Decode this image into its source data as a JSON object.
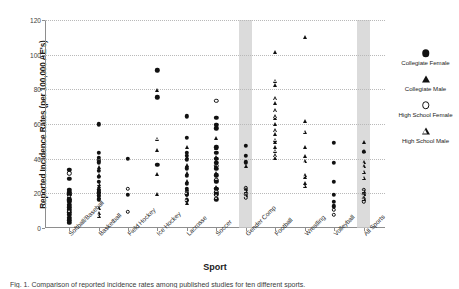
{
  "chart_data": {
    "type": "scatter",
    "title": "",
    "xlabel": "Sport",
    "ylabel": "Reported Incidence Rates (per 100,000 AE's)",
    "ylim": [
      0,
      120
    ],
    "yticks": [
      0,
      20,
      40,
      60,
      80,
      100,
      120
    ],
    "grid": true,
    "legend_position": "right",
    "categories": [
      "Softball/Baseball",
      "Basketball",
      "Field Hockey",
      "Ice Hockey",
      "Lacrosse",
      "Soccer",
      "Gender Comp",
      "Football",
      "Wrestling",
      "Volleyball",
      "All Sports"
    ],
    "highlighted_categories": [
      "Gender Comp",
      "All Sports"
    ],
    "series": [
      {
        "name": "Collegiate Female",
        "marker": "filled-circle",
        "color": "#111111",
        "points": [
          {
            "category": "Softball/Baseball",
            "values": [
              33.5,
              28.5,
              22.0,
              20.5,
              19.5,
              16.5,
              15.0,
              13.5,
              12.0,
              10.5,
              9.0,
              7.5,
              6.0,
              4.5,
              3.0
            ]
          },
          {
            "category": "Basketball",
            "values": [
              59.8,
              43.5,
              40.5,
              38.0,
              33.0,
              29.5,
              26.5,
              22.0,
              20.5,
              18.5,
              16.5
            ]
          },
          {
            "category": "Field Hockey",
            "values": [
              40.0,
              19.0
            ]
          },
          {
            "category": "Ice Hockey",
            "values": [
              91.0,
              75.5,
              36.5
            ]
          },
          {
            "category": "Lacrosse",
            "values": [
              64.5,
              52.0,
              43.5,
              41.5,
              39.5,
              34.5,
              30.0,
              25.5,
              22.5,
              19.5,
              16.0
            ]
          },
          {
            "category": "Soccer",
            "values": [
              63.5,
              59.5,
              57.5,
              46.5,
              43.5,
              40.0,
              37.5,
              34.0,
              30.5,
              26.5,
              22.5,
              19.5,
              16.5
            ]
          },
          {
            "category": "Gender Comp",
            "values": [
              47.5,
              41.5,
              38.0
            ]
          },
          {
            "category": "Football",
            "values": []
          },
          {
            "category": "Wrestling",
            "values": []
          },
          {
            "category": "Volleyball",
            "values": [
              49.0,
              37.5,
              26.5,
              19.0,
              15.0,
              12.5
            ]
          },
          {
            "category": "All Sports",
            "values": [
              44.0
            ]
          }
        ]
      },
      {
        "name": "Collegiate Male",
        "marker": "filled-triangle",
        "color": "#111111",
        "points": [
          {
            "category": "Softball/Baseball",
            "values": [
              20.5,
              18.0,
              14.0,
              11.5,
              8.5,
              6.0
            ]
          },
          {
            "category": "Basketball",
            "values": [
              35.0,
              30.5,
              24.5,
              21.5,
              18.0
            ]
          },
          {
            "category": "Field Hockey",
            "values": []
          },
          {
            "category": "Ice Hockey",
            "values": [
              79.5,
              45.0,
              31.0,
              19.5
            ]
          },
          {
            "category": "Lacrosse",
            "values": [
              46.5,
              41.0,
              36.5,
              31.5,
              27.0,
              22.5,
              14.5
            ]
          },
          {
            "category": "Soccer",
            "values": [
              52.0,
              46.0,
              41.0,
              38.5,
              35.5,
              31.5,
              27.5,
              23.5
            ]
          },
          {
            "category": "Gender Comp",
            "values": [
              36.0,
              22.5
            ]
          },
          {
            "category": "Football",
            "values": [
              101.5,
              82.5,
              72.0,
              63.5,
              60.0,
              54.0,
              49.5,
              46.5,
              40.5
            ]
          },
          {
            "category": "Wrestling",
            "values": [
              110.0,
              62.0,
              46.5,
              41.5,
              29.5,
              26.0
            ]
          },
          {
            "category": "Volleyball",
            "values": []
          },
          {
            "category": "All Sports",
            "values": [
              49.5,
              44.5
            ]
          }
        ]
      },
      {
        "name": "High School Female",
        "marker": "open-circle",
        "color": "#111111",
        "points": [
          {
            "category": "Softball/Baseball",
            "values": [
              31.5,
              19.0,
              16.0
            ]
          },
          {
            "category": "Basketball",
            "values": [
              39.0,
              22.0,
              20.0,
              18.5
            ]
          },
          {
            "category": "Field Hockey",
            "values": [
              22.5,
              9.5
            ]
          },
          {
            "category": "Ice Hockey",
            "values": []
          },
          {
            "category": "Lacrosse",
            "values": [
              21.0,
              19.5
            ]
          },
          {
            "category": "Soccer",
            "values": [
              73.5,
              36.0,
              27.5,
              22.5,
              20.5
            ]
          },
          {
            "category": "Gender Comp",
            "values": [
              23.0,
              19.5,
              17.5
            ]
          },
          {
            "category": "Football",
            "values": []
          },
          {
            "category": "Wrestling",
            "values": []
          },
          {
            "category": "Volleyball",
            "values": [
              10.5,
              7.5
            ]
          },
          {
            "category": "All Sports",
            "values": [
              22.0,
              19.5,
              17.0,
              15.5
            ]
          }
        ]
      },
      {
        "name": "High School Male",
        "marker": "open-triangle",
        "color": "#111111",
        "points": [
          {
            "category": "Softball/Baseball",
            "values": [
              18.5,
              10.0
            ]
          },
          {
            "category": "Basketball",
            "values": [
              25.5,
              11.5,
              8.5,
              7.0
            ]
          },
          {
            "category": "Field Hockey",
            "values": []
          },
          {
            "category": "Ice Hockey",
            "values": [
              51.5
            ]
          },
          {
            "category": "Lacrosse",
            "values": [
              20.5,
              16.5
            ]
          },
          {
            "category": "Soccer",
            "values": [
              28.5,
              21.5,
              19.5,
              17.5
            ]
          },
          {
            "category": "Gender Comp",
            "values": [
              21.5,
              19.0
            ]
          },
          {
            "category": "Football",
            "values": [
              85.0,
              75.0,
              68.0,
              64.5,
              56.5,
              51.0,
              44.5,
              42.0
            ]
          },
          {
            "category": "Wrestling",
            "values": [
              55.5,
              38.5,
              30.5,
              24.5
            ]
          },
          {
            "category": "Volleyball",
            "values": []
          },
          {
            "category": "All Sports",
            "values": [
              38.0,
              35.5,
              32.5,
              29.0,
              21.5,
              19.5,
              17.0
            ]
          }
        ]
      }
    ]
  },
  "legend": {
    "entries": [
      {
        "label": "Collegiate Female",
        "marker": "filled-circle"
      },
      {
        "label": "Collegiate Male",
        "marker": "filled-triangle"
      },
      {
        "label": "High School Female",
        "marker": "open-circle"
      },
      {
        "label": "High School Male",
        "marker": "open-triangle"
      }
    ]
  },
  "caption": "Fig. 1.  Comparison of reported incidence rates among published studies for ten different sports."
}
